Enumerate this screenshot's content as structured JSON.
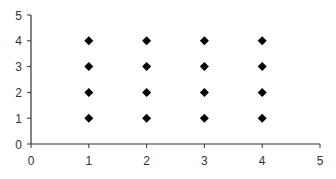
{
  "chart_data": {
    "type": "scatter",
    "title": "",
    "xlabel": "",
    "ylabel": "",
    "xlim": [
      0,
      5
    ],
    "ylim": [
      0,
      5
    ],
    "xticks": [
      0,
      1,
      2,
      3,
      4,
      5
    ],
    "yticks": [
      0,
      1,
      2,
      3,
      4,
      5
    ],
    "grid": false,
    "legend": null,
    "marker": "diamond",
    "marker_color": "#000000",
    "series": [
      {
        "name": "points",
        "points": [
          {
            "x": 1,
            "y": 1
          },
          {
            "x": 1,
            "y": 2
          },
          {
            "x": 1,
            "y": 3
          },
          {
            "x": 1,
            "y": 4
          },
          {
            "x": 2,
            "y": 1
          },
          {
            "x": 2,
            "y": 2
          },
          {
            "x": 2,
            "y": 3
          },
          {
            "x": 2,
            "y": 4
          },
          {
            "x": 3,
            "y": 1
          },
          {
            "x": 3,
            "y": 2
          },
          {
            "x": 3,
            "y": 3
          },
          {
            "x": 3,
            "y": 4
          },
          {
            "x": 4,
            "y": 1
          },
          {
            "x": 4,
            "y": 2
          },
          {
            "x": 4,
            "y": 3
          },
          {
            "x": 4,
            "y": 4
          }
        ]
      }
    ]
  }
}
